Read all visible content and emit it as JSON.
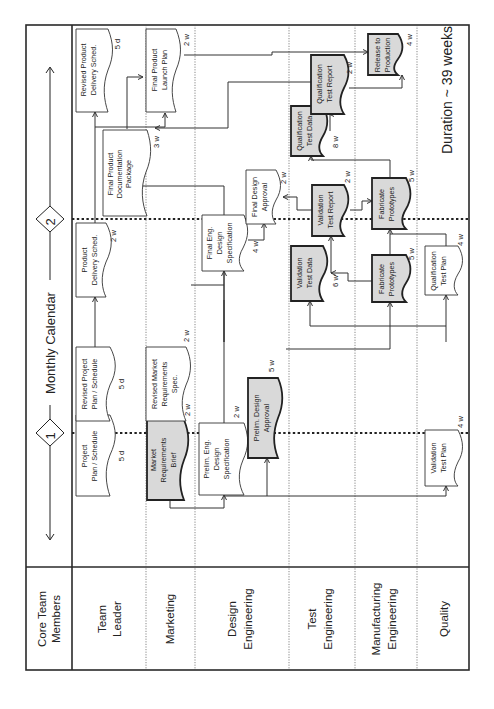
{
  "orientation": "rotated-90-ccw",
  "header": {
    "members_title": "Core Team Members",
    "calendar_title": "Monthly Calendar",
    "milestones": [
      {
        "id": "1",
        "label": "1"
      },
      {
        "id": "2",
        "label": "2"
      }
    ]
  },
  "lanes": [
    {
      "id": "team-leader",
      "label": "Team Leader",
      "lines": [
        "Team",
        "Leader"
      ]
    },
    {
      "id": "marketing",
      "label": "Marketing",
      "lines": [
        "Marketing"
      ]
    },
    {
      "id": "design-engineering",
      "label": "Design Engineering",
      "lines": [
        "Design",
        "Engineering"
      ]
    },
    {
      "id": "test-engineering",
      "label": "Test Engineering",
      "lines": [
        "Test",
        "Engineering"
      ]
    },
    {
      "id": "manufacturing-engineering",
      "label": "Manufacturing Engineering",
      "lines": [
        "Manufacturing",
        "Engineering"
      ]
    },
    {
      "id": "quality",
      "label": "Quality",
      "lines": [
        "Quality"
      ]
    }
  ],
  "tasks": [
    {
      "id": "project-plan",
      "lane": "team-leader",
      "lines": [
        "Project",
        "Plan / Schedule"
      ],
      "duration": "5 d",
      "shaded": false
    },
    {
      "id": "revised-project-plan",
      "lane": "team-leader",
      "lines": [
        "Revised Project",
        "Plan / Schedule"
      ],
      "duration": "5 d",
      "shaded": false
    },
    {
      "id": "product-delivery-sched",
      "lane": "team-leader",
      "lines": [
        "Product",
        "Delivery Sched."
      ],
      "duration": "2 w",
      "shaded": false
    },
    {
      "id": "revised-product-delivery-sched",
      "lane": "team-leader",
      "lines": [
        "Revised Product",
        "Delivery Sched."
      ],
      "duration": "5 d",
      "shaded": false
    },
    {
      "id": "final-product-doc-package",
      "lane": "team-leader",
      "lines": [
        "Final Product",
        "Documentation",
        "Package"
      ],
      "duration": "3 w",
      "shaded": false
    },
    {
      "id": "market-requirements-brief",
      "lane": "marketing",
      "lines": [
        "Market",
        "Requirements",
        "Brief"
      ],
      "duration": "2 w",
      "shaded": true
    },
    {
      "id": "revised-market-requirements-spec",
      "lane": "marketing",
      "lines": [
        "Revised Market",
        "Requirements",
        "Spec."
      ],
      "duration": "2 w",
      "shaded": false
    },
    {
      "id": "final-product-launch-plan",
      "lane": "marketing",
      "lines": [
        "Final Product",
        "Launch Plan"
      ],
      "duration": "2 w",
      "shaded": false
    },
    {
      "id": "prelim-eng-design-spec",
      "lane": "design-engineering",
      "lines": [
        "Prelim. Eng.",
        "Design",
        "Specification"
      ],
      "duration": "2 w",
      "shaded": false
    },
    {
      "id": "prelim-design-approval",
      "lane": "design-engineering",
      "lines": [
        "Prelim. Design",
        "Approval"
      ],
      "duration": "5 w",
      "shaded": true
    },
    {
      "id": "final-eng-design-spec",
      "lane": "design-engineering",
      "lines": [
        "Final Eng.",
        "Design",
        "Specification"
      ],
      "duration": "4 w",
      "shaded": false
    },
    {
      "id": "final-design-approval",
      "lane": "design-engineering",
      "lines": [
        "Final Design",
        "Approval"
      ],
      "duration": "2 w",
      "shaded": false
    },
    {
      "id": "validation-test-data",
      "lane": "test-engineering",
      "lines": [
        "Validation",
        "Test Data"
      ],
      "duration": "6 w",
      "shaded": true
    },
    {
      "id": "validation-test-report",
      "lane": "test-engineering",
      "lines": [
        "Validation",
        "Test Report"
      ],
      "duration": "2 w",
      "shaded": true
    },
    {
      "id": "qualification-test-data",
      "lane": "test-engineering",
      "lines": [
        "Qualification",
        "Test Data"
      ],
      "duration": "8 w",
      "shaded": true
    },
    {
      "id": "qualification-test-report",
      "lane": "test-engineering",
      "lines": [
        "Qualification",
        "Test Report"
      ],
      "duration": "2 w",
      "shaded": true
    },
    {
      "id": "fabricate-prototypes-1",
      "lane": "manufacturing-engineering",
      "lines": [
        "Fabricate",
        "Prototypes"
      ],
      "duration": "5 w",
      "shaded": true
    },
    {
      "id": "fabricate-prototypes-2",
      "lane": "manufacturing-engineering",
      "lines": [
        "Fabricate",
        "Prototypes"
      ],
      "duration": "5 w",
      "shaded": true
    },
    {
      "id": "release-to-production",
      "lane": "manufacturing-engineering",
      "lines": [
        "Release to",
        "Production"
      ],
      "duration": "4 w",
      "shaded": true
    },
    {
      "id": "validation-test-plan",
      "lane": "quality",
      "lines": [
        "Validation",
        "Test Plan"
      ],
      "duration": "4 w",
      "shaded": false
    },
    {
      "id": "qualification-test-plan",
      "lane": "quality",
      "lines": [
        "Qualification",
        "Test Plan"
      ],
      "duration": "4 w",
      "shaded": false
    }
  ],
  "footer": {
    "duration_label": "Duration ~ 39 weeks"
  },
  "colors": {
    "shaded_task": "#d9d9d9",
    "plain_task": "#ffffff",
    "line": "#333333"
  }
}
